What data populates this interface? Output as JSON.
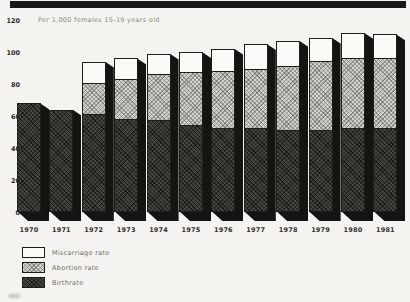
{
  "chart_data": {
    "type": "bar",
    "stacked": true,
    "unit_note": "Per 1,000 females 15-19 years old",
    "categories": [
      "1970",
      "1971",
      "1972",
      "1973",
      "1974",
      "1975",
      "1976",
      "1977",
      "1978",
      "1979",
      "1980",
      "1981"
    ],
    "series": [
      {
        "name": "Birthrate",
        "key": "birth",
        "values": [
          68,
          64,
          62,
          59,
          58,
          55,
          53,
          53,
          52,
          52,
          53,
          53
        ]
      },
      {
        "name": "Abortion rate",
        "key": "abortion",
        "values": [
          0,
          0,
          19,
          25,
          29,
          33,
          36,
          37,
          40,
          43,
          44,
          44
        ]
      },
      {
        "name": "Miscarriage rate",
        "key": "misc",
        "values": [
          0,
          0,
          13,
          12,
          12,
          12,
          13,
          15,
          15,
          14,
          15,
          14
        ]
      }
    ],
    "totals": [
      68,
      64,
      94,
      96,
      99,
      100,
      102,
      105,
      107,
      109,
      112,
      111
    ],
    "ylim": [
      0,
      120
    ],
    "yticks": [
      0,
      20,
      40,
      60,
      80,
      100,
      120
    ],
    "grid": false,
    "legend_position": "bottom-left",
    "legend": [
      {
        "label": "Miscarriage rate",
        "swatch": "misc"
      },
      {
        "label": "Abortion rate",
        "swatch": "abortion"
      },
      {
        "label": "Birthrate",
        "swatch": "birth"
      }
    ]
  },
  "colors": {
    "paper": "#f4f3ef",
    "ink": "#141412",
    "band": "#161614",
    "muted_text": "#8d8c86"
  }
}
